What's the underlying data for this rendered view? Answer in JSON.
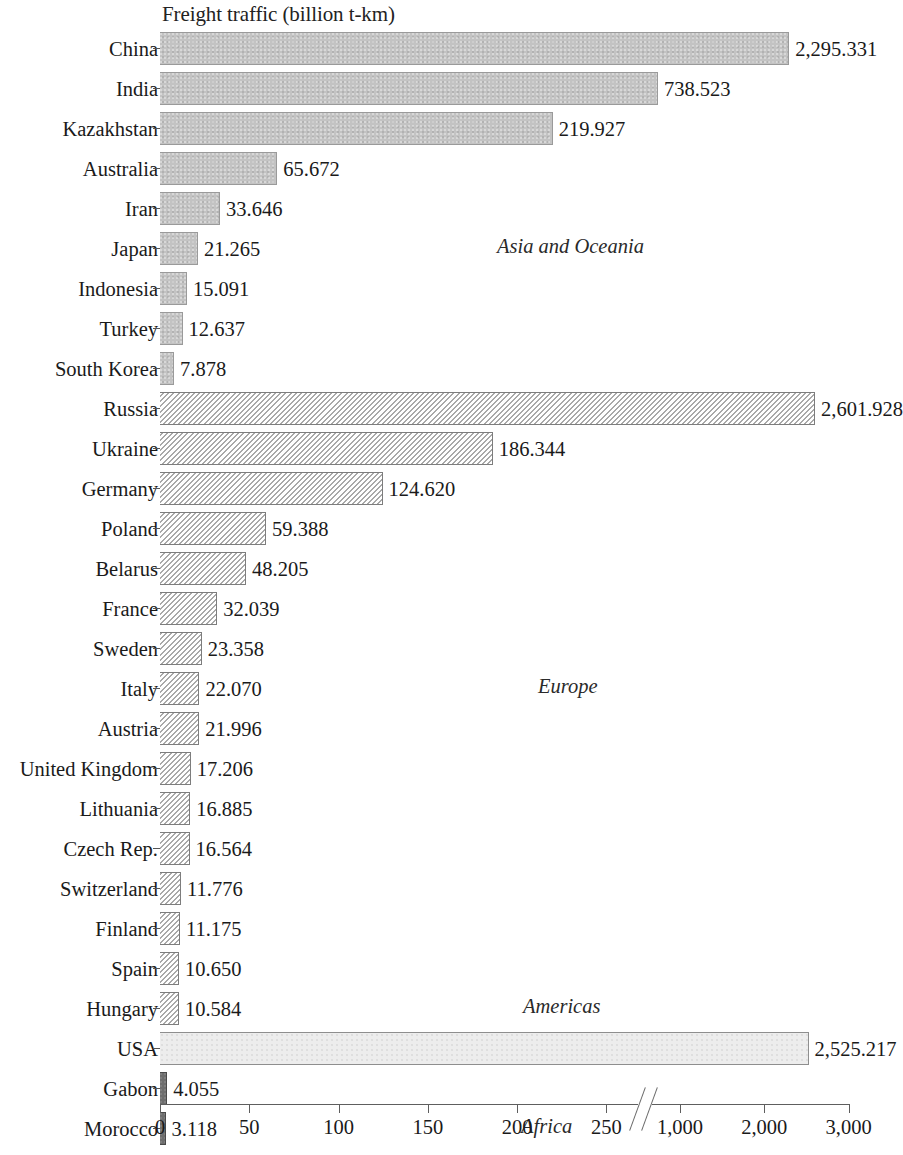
{
  "chart_data": {
    "type": "bar",
    "title": "Freight traffic (billion t-km)",
    "xlabel": "",
    "ylabel": "",
    "orientation": "horizontal",
    "grid": false,
    "axis_break": true,
    "xlim_segments": [
      [
        0,
        250
      ],
      [
        1000,
        3000
      ]
    ],
    "xticks": [
      "0",
      "50",
      "100",
      "150",
      "200",
      "250",
      "1,000",
      "2,000",
      "3,000"
    ],
    "xtick_values": [
      0,
      50,
      100,
      150,
      200,
      250,
      1000,
      2000,
      3000
    ],
    "categories": [
      "China",
      "India",
      "Kazakhstan",
      "Australia",
      "Iran",
      "Japan",
      "Indonesia",
      "Turkey",
      "South Korea",
      "Russia",
      "Ukraine",
      "Germany",
      "Poland",
      "Belarus",
      "France",
      "Sweden",
      "Italy",
      "Austria",
      "United Kingdom",
      "Lithuania",
      "Czech Rep.",
      "Switzerland",
      "Finland",
      "Spain",
      "Hungary",
      "USA",
      "Gabon",
      "Morocco"
    ],
    "values": [
      2295.331,
      738.523,
      219.927,
      65.672,
      33.646,
      21.265,
      15.091,
      12.637,
      7.878,
      2601.928,
      186.344,
      124.62,
      59.388,
      48.205,
      32.039,
      23.358,
      22.07,
      21.996,
      17.206,
      16.885,
      16.564,
      11.776,
      11.175,
      10.65,
      10.584,
      2525.217,
      4.055,
      3.118
    ],
    "value_labels": [
      "2,295.331",
      "738.523",
      "219.927",
      "65.672",
      "33.646",
      "21.265",
      "15.091",
      "12.637",
      "7.878",
      "2,601.928",
      "186.344",
      "124.620",
      "59.388",
      "48.205",
      "32.039",
      "23.358",
      "22.070",
      "21.996",
      "17.206",
      "16.885",
      "16.564",
      "11.776",
      "11.175",
      "10.650",
      "10.584",
      "2,525.217",
      "4.055",
      "3.118"
    ],
    "regions": [
      "Asia and Oceania",
      "Asia and Oceania",
      "Asia and Oceania",
      "Asia and Oceania",
      "Asia and Oceania",
      "Asia and Oceania",
      "Asia and Oceania",
      "Asia and Oceania",
      "Asia and Oceania",
      "Europe",
      "Europe",
      "Europe",
      "Europe",
      "Europe",
      "Europe",
      "Europe",
      "Europe",
      "Europe",
      "Europe",
      "Europe",
      "Europe",
      "Europe",
      "Europe",
      "Europe",
      "Europe",
      "Americas",
      "Africa",
      "Africa"
    ],
    "region_annotations": [
      {
        "label": "Asia and Oceania",
        "row_index": 5
      },
      {
        "label": "Europe",
        "row_index": 16
      },
      {
        "label": "Americas",
        "row_index": 24
      },
      {
        "label": "Africa",
        "row_index": 27
      }
    ],
    "region_colors": {
      "Asia and Oceania": "#c3c3c3",
      "Europe": "#fdfdfd",
      "Americas": "#ededed",
      "Africa": "#6e6e6e"
    }
  }
}
